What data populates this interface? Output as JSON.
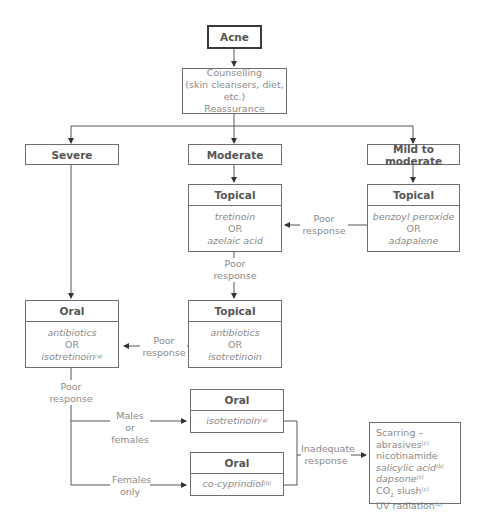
{
  "diagram": {
    "root": {
      "label": "Acne"
    },
    "counselling": {
      "lines": [
        "Counselling",
        "(skin cleansers, diet, etc.)",
        "Reassurance"
      ]
    },
    "severity": {
      "severe": "Severe",
      "moderate": "Moderate",
      "mild": "Mild to moderate"
    },
    "topical_moderate": {
      "title": "Topical",
      "line1": "tretinoin",
      "or": "OR",
      "line2": "azelaic acid"
    },
    "topical_mild": {
      "title": "Topical",
      "line1": "benzoyl peroxide",
      "or": "OR",
      "line2": "adapalene"
    },
    "topical_second": {
      "title": "Topical",
      "line1": "antibiotics",
      "or": "OR",
      "line2": "isotretinoin"
    },
    "oral_severe": {
      "title": "Oral",
      "line1": "antibiotics",
      "or": "OR",
      "line2": "isotretinoin",
      "sup": "(a)"
    },
    "oral_isotretinoin": {
      "title": "Oral",
      "drug": "isotretinoin",
      "sup": "(a)"
    },
    "oral_cocyprindiol": {
      "title": "Oral",
      "drug": "co-cyprindiol",
      "sup": "(b)"
    },
    "labels": {
      "poor": "Poor",
      "response": "response",
      "males_1": "Males or",
      "males_2": "females",
      "females_1": "Females",
      "females_2": "only",
      "inadequate_1": "Inadequate",
      "inadequate_2": "response"
    },
    "scarring": {
      "items": [
        {
          "text": "Scarring –",
          "sup": ""
        },
        {
          "text": "abrasives",
          "sup": "(c)"
        },
        {
          "text": "nicotinamide",
          "sup": ""
        },
        {
          "text": "salicylic acid",
          "sup": "(b)",
          "italic": true
        },
        {
          "text": "dapsone",
          "sup": "(c)",
          "italic": true
        },
        {
          "text": "CO",
          "sub": "2",
          "text2": " slush",
          "sup": "(c)"
        },
        {
          "text": "UV radiation",
          "sup": "(b)"
        }
      ]
    }
  }
}
